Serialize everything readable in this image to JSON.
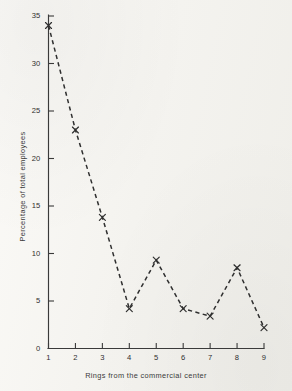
{
  "figure": {
    "background_color": "#f6f5f1",
    "ink_color": "#3a3a3a"
  },
  "chart_data": {
    "type": "line",
    "title": "",
    "subtitle": "",
    "xlabel": "Rings from the commercial center",
    "ylabel": "Percentage of total employees",
    "x": [
      1,
      2,
      3,
      4,
      5,
      6,
      7,
      8,
      9
    ],
    "values": [
      34.0,
      23.0,
      13.8,
      4.2,
      9.3,
      4.2,
      3.4,
      8.5,
      2.2
    ],
    "series": [
      {
        "name": "Percentage of total employees",
        "values": [
          34.0,
          23.0,
          13.8,
          4.2,
          9.3,
          4.2,
          3.4,
          8.5,
          2.2
        ]
      }
    ],
    "xlim": [
      1,
      9
    ],
    "ylim": [
      0,
      35
    ],
    "xticks": [
      1,
      2,
      3,
      4,
      5,
      6,
      7,
      8,
      9
    ],
    "yticks": [
      0,
      5,
      10,
      15,
      20,
      25,
      30,
      35
    ],
    "xtick_labels": [
      "1",
      "2",
      "3",
      "4",
      "5",
      "6",
      "7",
      "8",
      "9"
    ],
    "ytick_labels": [
      "0",
      "5",
      "10",
      "15",
      "20",
      "25",
      "30",
      "35"
    ],
    "grid": false,
    "legend": false,
    "legend_position": "none",
    "line_style": "dashed",
    "marker": "x",
    "line_color": "#2f2f2f",
    "marker_color": "#2f2f2f",
    "annotations": []
  }
}
